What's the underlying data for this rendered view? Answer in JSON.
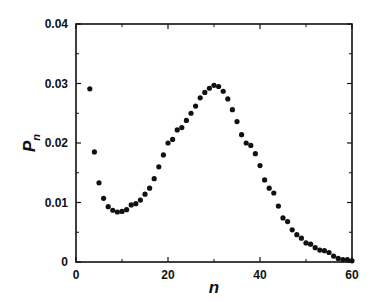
{
  "chart_data": {
    "type": "scatter",
    "title": "",
    "xlabel": "n",
    "ylabel": "P_n",
    "ylabel_main": "P",
    "ylabel_sub": "n",
    "xlim": [
      0,
      60
    ],
    "ylim": [
      0,
      0.04
    ],
    "x_ticks": [
      0,
      20,
      40,
      60
    ],
    "x_tick_labels": [
      "0",
      "20",
      "40",
      "60"
    ],
    "x_minor_ticks": [
      10,
      30,
      50
    ],
    "y_ticks": [
      0,
      0.01,
      0.02,
      0.03,
      0.04
    ],
    "y_tick_labels": [
      "0",
      "0.01",
      "0.02",
      "0.03",
      "0.04"
    ],
    "y_minor_ticks": [
      0.005,
      0.015,
      0.025,
      0.035
    ],
    "grid": false,
    "legend": null,
    "marker_color": "#111111",
    "series": [
      {
        "name": "P_n",
        "x": [
          3,
          4,
          5,
          6,
          7,
          8,
          9,
          10,
          11,
          12,
          13,
          14,
          15,
          16,
          17,
          18,
          19,
          20,
          21,
          22,
          23,
          24,
          25,
          26,
          27,
          28,
          29,
          30,
          31,
          32,
          33,
          34,
          35,
          36,
          37,
          38,
          39,
          40,
          41,
          42,
          43,
          44,
          45,
          46,
          47,
          48,
          49,
          50,
          51,
          52,
          53,
          54,
          55,
          56,
          57,
          58,
          59,
          60
        ],
        "values": [
          0.0291,
          0.0185,
          0.0133,
          0.0107,
          0.0093,
          0.0087,
          0.0084,
          0.0085,
          0.0088,
          0.0096,
          0.0098,
          0.0104,
          0.0114,
          0.0124,
          0.014,
          0.016,
          0.018,
          0.02,
          0.0206,
          0.0222,
          0.0226,
          0.0238,
          0.025,
          0.0262,
          0.0276,
          0.0285,
          0.0292,
          0.0297,
          0.0295,
          0.0287,
          0.0274,
          0.0256,
          0.0236,
          0.0214,
          0.02,
          0.0196,
          0.0182,
          0.0162,
          0.0138,
          0.0124,
          0.0116,
          0.0094,
          0.0074,
          0.0068,
          0.0054,
          0.0046,
          0.004,
          0.0032,
          0.003,
          0.0024,
          0.002,
          0.0019,
          0.0016,
          0.001,
          0.0006,
          0.0004,
          0.0004,
          0.0002
        ]
      }
    ]
  }
}
